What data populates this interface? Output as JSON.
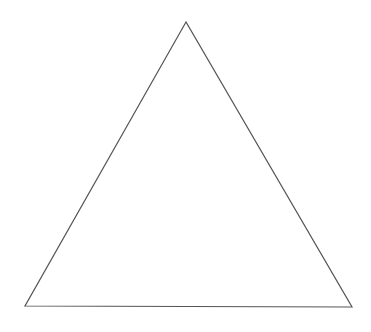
{
  "canvas": {
    "width": 371,
    "height": 332,
    "background": "#ffffff"
  },
  "shape": {
    "type": "triangle",
    "points": "186,22 25,306 352,307",
    "stroke": "#555555",
    "stroke_width": "1.2",
    "fill": "#ffffff"
  }
}
